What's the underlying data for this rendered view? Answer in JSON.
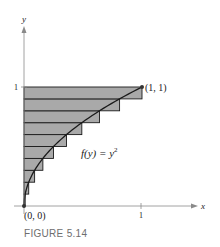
{
  "figure": {
    "caption": "FIGURE 5.14",
    "axis_x_label": "x",
    "axis_y_label": "y",
    "tick_x": "1",
    "tick_y": "1",
    "point_origin_label": "(0, 0)",
    "point_end_label": "(1, 1)",
    "function_label": "f(y) = y",
    "function_exponent": "2",
    "colors": {
      "rect_fill": "#a9a9a9",
      "rect_stroke": "#1a1a1a",
      "curve": "#1a1a1a",
      "axis": "#8a8a8a"
    }
  },
  "chart_data": {
    "type": "area",
    "title": "FIGURE 5.14",
    "function": "f(y) = y^2",
    "xlabel": "x",
    "ylabel": "y",
    "xlim": [
      0,
      1
    ],
    "ylim": [
      0,
      1
    ],
    "n_rectangles": 10,
    "rectangles": [
      {
        "y0": 0.0,
        "y1": 0.1,
        "width": 0.01
      },
      {
        "y0": 0.1,
        "y1": 0.2,
        "width": 0.04
      },
      {
        "y0": 0.2,
        "y1": 0.3,
        "width": 0.09
      },
      {
        "y0": 0.3,
        "y1": 0.4,
        "width": 0.16
      },
      {
        "y0": 0.4,
        "y1": 0.5,
        "width": 0.25
      },
      {
        "y0": 0.5,
        "y1": 0.6,
        "width": 0.36
      },
      {
        "y0": 0.6,
        "y1": 0.7,
        "width": 0.49
      },
      {
        "y0": 0.7,
        "y1": 0.8,
        "width": 0.64
      },
      {
        "y0": 0.8,
        "y1": 0.9,
        "width": 0.81
      },
      {
        "y0": 0.9,
        "y1": 1.0,
        "width": 1.0
      }
    ],
    "points": [
      {
        "label": "(0, 0)",
        "x": 0,
        "y": 0
      },
      {
        "label": "(1, 1)",
        "x": 1,
        "y": 1
      }
    ],
    "grid": false
  }
}
